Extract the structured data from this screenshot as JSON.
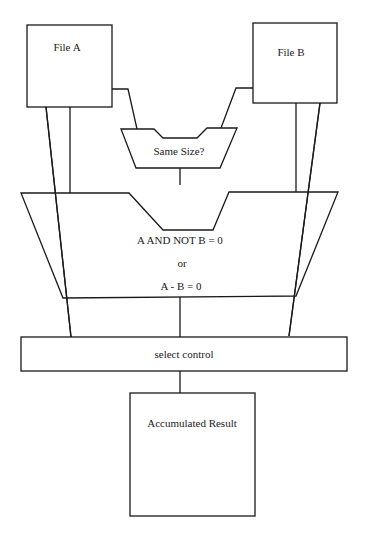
{
  "diagram": {
    "nodes": {
      "file_a": {
        "label": "File A"
      },
      "file_b": {
        "label": "File B"
      },
      "same_size": {
        "label": "Same Size?"
      },
      "comparator": {
        "line1": "A AND NOT B = 0",
        "line2": "or",
        "line3": "A - B = 0"
      },
      "select_control": {
        "label": "select control"
      },
      "accumulated_result": {
        "label": "Accumulated Result"
      }
    },
    "edges": [
      {
        "from": "File A",
        "to": "Same Size?"
      },
      {
        "from": "File B",
        "to": "Same Size?"
      },
      {
        "from": "File A",
        "to": "A AND NOT B = 0 / A - B = 0"
      },
      {
        "from": "File B",
        "to": "A AND NOT B = 0 / A - B = 0"
      },
      {
        "from": "File A",
        "to": "select control"
      },
      {
        "from": "File B",
        "to": "select control"
      },
      {
        "from": "Same Size?",
        "to": "A AND NOT B = 0 / A - B = 0"
      },
      {
        "from": "A AND NOT B = 0 / A - B = 0",
        "to": "select control"
      },
      {
        "from": "select control",
        "to": "Accumulated Result"
      }
    ],
    "colors": {
      "line": "#1a1a1a",
      "background": "#ffffff"
    }
  }
}
